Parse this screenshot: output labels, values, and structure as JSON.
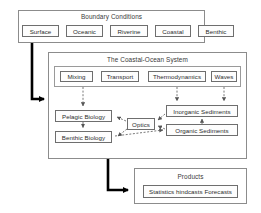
{
  "diagram": {
    "boundary": {
      "title": "Boundary Conditions",
      "nodes": [
        {
          "label": "Surface"
        },
        {
          "label": "Oceanic"
        },
        {
          "label": "Riverine"
        },
        {
          "label": "Coastal"
        },
        {
          "label": "Benthic"
        }
      ]
    },
    "system": {
      "title": "The Coastal-Ocean System",
      "processes": [
        {
          "label": "Mixing"
        },
        {
          "label": "Transport"
        },
        {
          "label": "Thermodynamics"
        },
        {
          "label": "Waves"
        }
      ],
      "components": [
        {
          "label": "Pelagic Biology"
        },
        {
          "label": "Benthic Biology"
        },
        {
          "label": "Optics"
        },
        {
          "label": "Inorganic Sediments"
        },
        {
          "label": "Organic Sediments"
        }
      ]
    },
    "products": {
      "title": "Products",
      "nodes": [
        {
          "label": "Statistics hindcasts Forecasts"
        }
      ]
    },
    "colors": {
      "box_border": "#6e6e6e",
      "panel_border": "#8c8c8c",
      "arrow_thick": "#000000",
      "arrow_thin": "#555555",
      "text": "#2c2c2c",
      "background": "#ffffff"
    }
  }
}
